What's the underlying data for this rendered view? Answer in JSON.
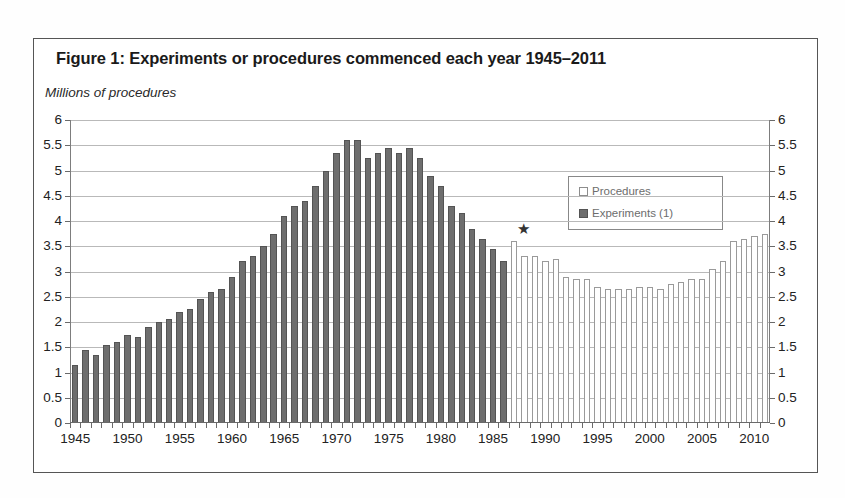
{
  "figure": {
    "title": "Figure 1: Experiments or procedures commenced each year 1945–2011",
    "yaxis_unit_label": "Millions of procedures"
  },
  "legend": {
    "position": "inside-top-right",
    "items": [
      {
        "label": "Procedures",
        "swatch": "hollow-square",
        "color": "#ffffff"
      },
      {
        "label": "Experiments (1)",
        "swatch": "filled-square",
        "color": "#6e6e6e"
      }
    ]
  },
  "annotations": [
    {
      "name": "star-marker",
      "glyph": "★",
      "x_year": 1988,
      "y_value": 3.85
    }
  ],
  "colors": {
    "experiments_bar": "#6e6e6e",
    "procedures_bar": "#ffffff",
    "procedures_border": "#9a9a9a",
    "gridline": "#b9b9b9",
    "axis": "#6a6a6a",
    "frame": "#555555"
  },
  "chart_data": {
    "type": "bar",
    "title": "Figure 1: Experiments or procedures commenced each year 1945–2011",
    "xlabel": "",
    "ylabel": "Millions of procedures",
    "ylim": [
      0,
      6
    ],
    "ytick_values": [
      0,
      0.5,
      1,
      1.5,
      2,
      2.5,
      3,
      3.5,
      4,
      4.5,
      5,
      5.5,
      6
    ],
    "ytick_labels": [
      "0",
      "0.5",
      "1",
      "1.5",
      "2",
      "2.5",
      "3",
      "3.5",
      "4",
      "4.5",
      "5",
      "5.5",
      "6"
    ],
    "ytick_labels_right": [
      "0",
      "0.5",
      "1",
      "1.5",
      "2",
      "2.5",
      "3",
      "3.5",
      "4",
      "4.5",
      "5",
      "5.5",
      "6"
    ],
    "xtick_labels": [
      "1945",
      "1950",
      "1955",
      "1960",
      "1965",
      "1970",
      "1975",
      "1980",
      "1985",
      "1990",
      "1995",
      "2000",
      "2005",
      "2010"
    ],
    "grid": true,
    "legend_position": "inside-top-right",
    "x": [
      1945,
      1946,
      1947,
      1948,
      1949,
      1950,
      1951,
      1952,
      1953,
      1954,
      1955,
      1956,
      1957,
      1958,
      1959,
      1960,
      1961,
      1962,
      1963,
      1964,
      1965,
      1966,
      1967,
      1968,
      1969,
      1970,
      1971,
      1972,
      1973,
      1974,
      1975,
      1976,
      1977,
      1978,
      1979,
      1980,
      1981,
      1982,
      1983,
      1984,
      1985,
      1986,
      1987,
      1988,
      1989,
      1990,
      1991,
      1992,
      1993,
      1994,
      1995,
      1996,
      1997,
      1998,
      1999,
      2000,
      2001,
      2002,
      2003,
      2004,
      2005,
      2006,
      2007,
      2008,
      2009,
      2010,
      2011
    ],
    "series": [
      {
        "name": "Experiments (1)",
        "color": "#6e6e6e",
        "values": [
          1.15,
          1.45,
          1.35,
          1.55,
          1.6,
          1.75,
          1.7,
          1.9,
          2.0,
          2.05,
          2.2,
          2.25,
          2.45,
          2.6,
          2.65,
          2.9,
          3.2,
          3.3,
          3.5,
          3.75,
          4.1,
          4.3,
          4.4,
          4.7,
          5.0,
          5.35,
          5.6,
          5.6,
          5.25,
          5.35,
          5.45,
          5.35,
          5.45,
          5.25,
          4.9,
          4.7,
          4.3,
          4.15,
          3.85,
          3.65,
          3.45,
          3.2,
          2.95,
          null,
          null,
          null,
          null,
          null,
          null,
          null,
          null,
          null,
          null,
          null,
          null,
          null,
          null,
          null,
          null,
          null,
          null,
          null,
          null,
          null,
          null,
          null,
          null
        ]
      },
      {
        "name": "Procedures",
        "color": "#ffffff",
        "values": [
          null,
          null,
          null,
          null,
          null,
          null,
          null,
          null,
          null,
          null,
          null,
          null,
          null,
          null,
          null,
          null,
          null,
          null,
          null,
          null,
          null,
          null,
          null,
          null,
          null,
          null,
          null,
          null,
          null,
          null,
          null,
          null,
          null,
          null,
          null,
          null,
          null,
          null,
          null,
          null,
          null,
          null,
          3.6,
          3.3,
          3.3,
          3.2,
          3.25,
          2.9,
          2.85,
          2.85,
          2.7,
          2.65,
          2.65,
          2.65,
          2.7,
          2.7,
          2.65,
          2.75,
          2.8,
          2.85,
          2.85,
          3.05,
          3.2,
          3.6,
          3.65,
          3.7,
          3.75
        ]
      }
    ]
  }
}
